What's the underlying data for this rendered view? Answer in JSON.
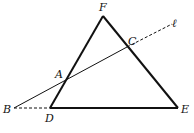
{
  "diagram": {
    "type": "geometry",
    "triangle": {
      "vertices": [
        "D",
        "E",
        "F"
      ]
    },
    "points": [
      {
        "id": "F",
        "label": "F",
        "x": 103,
        "y": 16,
        "lx": 99,
        "ly": 11
      },
      {
        "id": "D",
        "label": "D",
        "x": 50,
        "y": 108,
        "lx": 45,
        "ly": 122
      },
      {
        "id": "E",
        "label": "E",
        "x": 178,
        "y": 108,
        "lx": 181,
        "ly": 113
      },
      {
        "id": "C",
        "label": "C",
        "x": 127,
        "y": 47,
        "lx": 128,
        "ly": 45
      },
      {
        "id": "A",
        "label": "A",
        "x": 66,
        "y": 80,
        "lx": 55,
        "ly": 78
      },
      {
        "id": "B",
        "label": "B",
        "x": 14,
        "y": 108,
        "lx": 3,
        "ly": 113
      }
    ],
    "line_label": {
      "label": "ℓ",
      "x": 173,
      "y": 27
    },
    "segments": [
      {
        "from": "D",
        "to": "F",
        "style": "solid-thick"
      },
      {
        "from": "F",
        "to": "E",
        "style": "solid-thick"
      },
      {
        "from": "D",
        "to": "E",
        "style": "solid-thick"
      },
      {
        "from": "B",
        "to": "C",
        "style": "solid-thin"
      },
      {
        "from": "C",
        "to": "ℓ",
        "style": "dashed"
      },
      {
        "from": "B",
        "to": "D",
        "style": "dashed"
      }
    ]
  }
}
